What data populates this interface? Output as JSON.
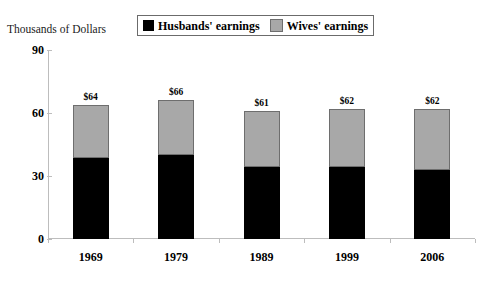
{
  "chart_data": {
    "type": "bar",
    "subtype": "stacked-bar",
    "title": "",
    "axis_title": "Thousands of Dollars",
    "xlabel": "",
    "ylabel": "Thousands of Dollars",
    "categories": [
      "1969",
      "1979",
      "1989",
      "1999",
      "2006"
    ],
    "series": [
      {
        "name": "Husbands' earnings",
        "color": "#000000",
        "values": [
          38.6,
          40.1,
          34.3,
          34.3,
          32.9
        ]
      },
      {
        "name": "Wives' earnings",
        "color": "#a8a8a8",
        "values": [
          25.4,
          26.1,
          26.6,
          27.5,
          28.9
        ]
      }
    ],
    "totals": [
      64,
      66,
      61,
      62,
      62
    ],
    "bar_labels": [
      "$64",
      "$66",
      "$61",
      "$62",
      "$62"
    ],
    "ylim": [
      0,
      90
    ],
    "yticks": [
      0,
      30,
      60,
      90
    ],
    "ytick_labels": [
      "0",
      "30",
      "60",
      "90"
    ],
    "grid": false,
    "legend_position": "top-center"
  },
  "legend": {
    "entries": [
      {
        "label": "Husbands' earnings",
        "color": "#000000",
        "swatch_name": "husbands-swatch"
      },
      {
        "label": "Wives' earnings",
        "color": "#a8a8a8",
        "swatch_name": "wives-swatch"
      }
    ]
  }
}
